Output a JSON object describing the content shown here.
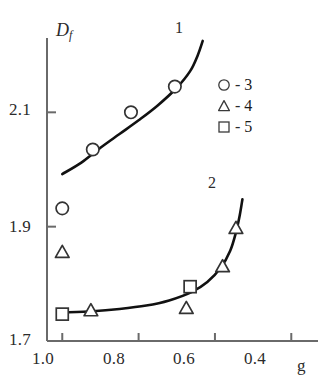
{
  "figure": {
    "background_color": "#ffffff",
    "line_color": "#111111",
    "axis_color": "#555555",
    "marker_stroke_color": "#333333"
  },
  "axes": {
    "y_title": "D",
    "y_title_sub": "f",
    "x_title": "g",
    "y_ticks": [
      "2.1",
      "1.9",
      "1.7"
    ],
    "y_tick_values": [
      2.1,
      1.9,
      1.7
    ],
    "x_ticks": [
      "1.0",
      "0.8",
      "0.6",
      "0.4"
    ],
    "x_tick_values": [
      1.0,
      0.8,
      0.6,
      0.4
    ],
    "xlim": [
      1.04,
      0.33
    ],
    "ylim": [
      1.7,
      2.23
    ],
    "grid": false
  },
  "curve_labels": {
    "curve1": "1",
    "curve2": "2"
  },
  "legend": {
    "position": "top-right",
    "entries": [
      {
        "symbol": "circle",
        "dash": "-",
        "label": "3"
      },
      {
        "symbol": "triangle",
        "dash": "-",
        "label": "4"
      },
      {
        "symbol": "square",
        "dash": "-",
        "label": "5"
      }
    ]
  },
  "chart_data": {
    "type": "scatter",
    "title": "",
    "xlabel": "g",
    "ylabel": "Df",
    "xlim": [
      1.04,
      0.33
    ],
    "ylim": [
      1.7,
      2.23
    ],
    "grid": false,
    "legend_position": "top-right",
    "series": [
      {
        "name": "3",
        "marker": "circle",
        "points": [
          {
            "x": 1.0,
            "y": 1.932
          },
          {
            "x": 0.92,
            "y": 2.035
          },
          {
            "x": 0.82,
            "y": 2.1
          },
          {
            "x": 0.705,
            "y": 2.145
          }
        ]
      },
      {
        "name": "4",
        "marker": "triangle",
        "points": [
          {
            "x": 1.0,
            "y": 1.855
          },
          {
            "x": 0.925,
            "y": 1.753
          },
          {
            "x": 0.675,
            "y": 1.757
          },
          {
            "x": 0.58,
            "y": 1.83
          },
          {
            "x": 0.545,
            "y": 1.897
          }
        ]
      },
      {
        "name": "5",
        "marker": "square",
        "points": [
          {
            "x": 1.0,
            "y": 1.747
          },
          {
            "x": 0.665,
            "y": 1.795
          }
        ]
      }
    ],
    "curves": [
      {
        "name": "1",
        "label": "1",
        "points": [
          {
            "x": 1.0,
            "y": 1.992
          },
          {
            "x": 0.95,
            "y": 2.012
          },
          {
            "x": 0.9,
            "y": 2.038
          },
          {
            "x": 0.85,
            "y": 2.062
          },
          {
            "x": 0.8,
            "y": 2.086
          },
          {
            "x": 0.75,
            "y": 2.112
          },
          {
            "x": 0.7,
            "y": 2.143
          },
          {
            "x": 0.665,
            "y": 2.172
          },
          {
            "x": 0.645,
            "y": 2.2
          },
          {
            "x": 0.632,
            "y": 2.225
          }
        ]
      },
      {
        "name": "2",
        "label": "2",
        "points": [
          {
            "x": 1.0,
            "y": 1.75
          },
          {
            "x": 0.92,
            "y": 1.752
          },
          {
            "x": 0.85,
            "y": 1.756
          },
          {
            "x": 0.78,
            "y": 1.762
          },
          {
            "x": 0.72,
            "y": 1.771
          },
          {
            "x": 0.66,
            "y": 1.786
          },
          {
            "x": 0.62,
            "y": 1.803
          },
          {
            "x": 0.585,
            "y": 1.828
          },
          {
            "x": 0.56,
            "y": 1.858
          },
          {
            "x": 0.545,
            "y": 1.89
          },
          {
            "x": 0.535,
            "y": 1.92
          },
          {
            "x": 0.528,
            "y": 1.948
          }
        ]
      }
    ]
  }
}
